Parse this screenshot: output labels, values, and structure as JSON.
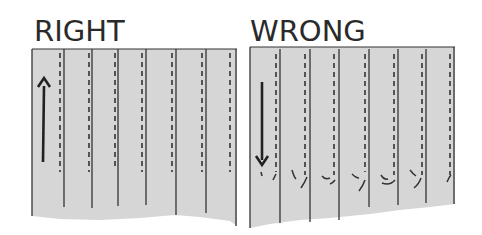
{
  "panels": [
    {
      "label": "RIGHT",
      "arrow_direction": "up"
    },
    {
      "label": "WRONG",
      "arrow_direction": "down"
    }
  ],
  "colors": {
    "fabric": "#d6d6d6",
    "line": "#333333",
    "text": "#2a2a2a",
    "background": "#ffffff"
  }
}
